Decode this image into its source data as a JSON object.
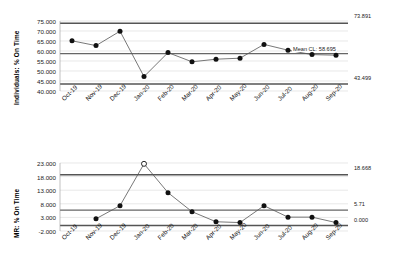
{
  "chart_data": [
    {
      "id": "individuals",
      "type": "line",
      "title": "",
      "ylabel": "Individuals: % On Time",
      "xlabel": "",
      "categories": [
        "Oct-19",
        "Nov-19",
        "Dec-19",
        "Jan-20",
        "Feb-20",
        "Mar-20",
        "Apr-20",
        "May-20",
        "Jun-20",
        "Jul-20",
        "Aug-20",
        "Sep-20"
      ],
      "values": [
        65.1,
        62.7,
        69.9,
        47.2,
        59.2,
        54.6,
        55.9,
        56.4,
        63.3,
        60.4,
        58.2,
        57.9
      ],
      "ylim": [
        40.0,
        75.0
      ],
      "yticks": [
        "75.000",
        "70.000",
        "65.000",
        "60.000",
        "55.000",
        "50.000",
        "45.000",
        "40.000"
      ],
      "ytick_values": [
        75.0,
        70.0,
        65.0,
        60.0,
        55.0,
        50.0,
        45.0,
        40.0
      ],
      "grid": true,
      "legend": "none",
      "control_limits": {
        "ucl_value": 73.891,
        "ucl_label": "73.891",
        "center_value": 58.695,
        "center_label": "Mean CL: 58.695",
        "lcl_value": 43.499,
        "lcl_label": "43.499"
      },
      "marker_style": "filled-circle",
      "out_of_control_points": []
    },
    {
      "id": "moving-range",
      "type": "line",
      "title": "",
      "ylabel": "MR: % On Time",
      "xlabel": "",
      "categories": [
        "Oct-19",
        "Nov-19",
        "Dec-19",
        "Jan-20",
        "Feb-20",
        "Mar-20",
        "Apr-20",
        "May-20",
        "Jun-20",
        "Jul-20",
        "Aug-20",
        "Sep-20"
      ],
      "values": [
        null,
        2.5,
        7.3,
        22.7,
        12.1,
        5.1,
        1.4,
        1.1,
        7.3,
        3.1,
        3.1,
        1.1
      ],
      "ylim": [
        -2.0,
        23.0
      ],
      "yticks": [
        "23.000",
        "18.000",
        "13.000",
        "8.000",
        "3.000",
        "-2.000"
      ],
      "ytick_values": [
        23.0,
        18.0,
        13.0,
        8.0,
        3.0,
        -2.0
      ],
      "grid": true,
      "legend": "none",
      "control_limits": {
        "ucl_value": 18.668,
        "ucl_label": "18.668",
        "center_value": 5.71,
        "center_label": "5.71",
        "lcl_value": 0.0,
        "lcl_label": "0.000"
      },
      "marker_style": "filled-circle",
      "out_of_control_points": [
        "Jan-20"
      ]
    }
  ],
  "style": {
    "line_color": "#555555",
    "marker_color": "#111111",
    "limit_color": "#555555",
    "center_color": "#666666",
    "grid_color": "#d8d8d8",
    "text_color": "#1a1a1a"
  }
}
